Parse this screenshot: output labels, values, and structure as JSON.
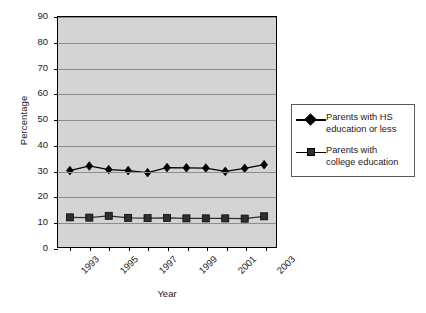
{
  "chart_data": {
    "type": "line",
    "title": "",
    "xlabel": "Year",
    "ylabel": "Percentage",
    "x": [
      1993,
      1994,
      1995,
      1996,
      1997,
      1998,
      1999,
      2000,
      2001,
      2002,
      2003
    ],
    "categories": [
      "1993",
      "1994",
      "1995",
      "1996",
      "1997",
      "1998",
      "1999",
      "2000",
      "2001",
      "2002",
      "2003"
    ],
    "xtick_labels": [
      "1993",
      "1995",
      "1997",
      "1999",
      "2001",
      "2003"
    ],
    "ytick_labels": [
      "0",
      "10",
      "20",
      "30",
      "40",
      "50",
      "60",
      "70",
      "80",
      "90"
    ],
    "ylim": [
      0,
      90
    ],
    "ytick_step": 10,
    "grid": "horizontal",
    "legend_position": "right",
    "plot_background": "#d4d4d4",
    "gridline_color": "#8d8d8d",
    "series": [
      {
        "name": "Parents with HS education or less",
        "marker": "diamond",
        "color": "#000000",
        "values": [
          29.9,
          31.7,
          30.3,
          29.9,
          29.1,
          31.1,
          31.0,
          30.9,
          29.6,
          30.8,
          32.2
        ]
      },
      {
        "name": "Parents with college education",
        "marker": "square",
        "color": "#2e2e2e",
        "values": [
          11.6,
          11.5,
          12.2,
          11.4,
          11.3,
          11.4,
          11.2,
          11.2,
          11.2,
          11.1,
          12.0
        ]
      }
    ]
  },
  "legend": {
    "items": [
      {
        "label_line1": "Parents with HS",
        "label_line2": "education or less",
        "marker": "diamond-marker"
      },
      {
        "label_line1": "Parents with",
        "label_line2": "college education",
        "marker": "square-marker"
      }
    ]
  },
  "axes": {
    "x_title": "Year",
    "y_title": "Percentage"
  }
}
